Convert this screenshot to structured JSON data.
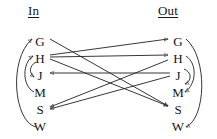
{
  "figure": {
    "type": "bipartite-mapping-diagram",
    "width": 217,
    "height": 139,
    "background_color": "#ffffff",
    "stroke_color": "#202020",
    "text_color": "#151515"
  },
  "headers": {
    "left": "In",
    "right": "Out"
  },
  "nodes": {
    "left_column": [
      {
        "key": "G",
        "label": "G",
        "x": 40,
        "y": 41
      },
      {
        "key": "H",
        "label": "H",
        "x": 40,
        "y": 58
      },
      {
        "key": "J",
        "label": "J",
        "x": 40,
        "y": 75
      },
      {
        "key": "M",
        "label": "M",
        "x": 40,
        "y": 92
      },
      {
        "key": "S",
        "label": "S",
        "x": 40,
        "y": 109
      },
      {
        "key": "W",
        "label": "W",
        "x": 40,
        "y": 126
      }
    ],
    "right_column": [
      {
        "key": "G",
        "label": "G",
        "x": 178,
        "y": 41
      },
      {
        "key": "H",
        "label": "H",
        "x": 178,
        "y": 58
      },
      {
        "key": "J",
        "label": "J",
        "x": 178,
        "y": 75
      },
      {
        "key": "M",
        "label": "M",
        "x": 178,
        "y": 92
      },
      {
        "key": "S",
        "label": "S",
        "x": 178,
        "y": 109
      },
      {
        "key": "W",
        "label": "W",
        "x": 178,
        "y": 126
      }
    ]
  },
  "edges": {
    "straight": [
      {
        "id": "e1",
        "from": "in-G",
        "to": "out-S",
        "direction": "left-to-right"
      },
      {
        "id": "e2",
        "from": "in-H",
        "to": "out-G",
        "direction": "left-to-right"
      },
      {
        "id": "e3",
        "from": "in-H",
        "to": "out-H",
        "direction": "left-to-right"
      },
      {
        "id": "e4",
        "from": "in-H",
        "to": "out-S",
        "direction": "left-to-right"
      },
      {
        "id": "e5",
        "from": "out-J",
        "to": "in-J",
        "direction": "right-to-left"
      },
      {
        "id": "e6",
        "from": "out-H",
        "to": "in-S",
        "direction": "right-to-left"
      },
      {
        "id": "e7",
        "from": "out-J",
        "to": "in-S",
        "direction": "right-to-left"
      }
    ],
    "arcs": [
      {
        "id": "a1",
        "side": "left",
        "from": "in-W",
        "to": "in-G",
        "shape": "long-outer-arc"
      },
      {
        "id": "a2",
        "side": "left",
        "from": "in-M",
        "to": "in-H",
        "shape": "medium-arc"
      },
      {
        "id": "a3",
        "side": "left",
        "from": "in-H",
        "to": "in-J",
        "shape": "short-arc"
      },
      {
        "id": "a4",
        "side": "right",
        "from": "out-G",
        "to": "out-W",
        "shape": "long-outer-arc"
      },
      {
        "id": "a5",
        "side": "right",
        "from": "out-H",
        "to": "out-M",
        "shape": "medium-arc"
      },
      {
        "id": "a6",
        "side": "right",
        "from": "out-J",
        "to": "out-J",
        "shape": "short-arc"
      }
    ]
  }
}
